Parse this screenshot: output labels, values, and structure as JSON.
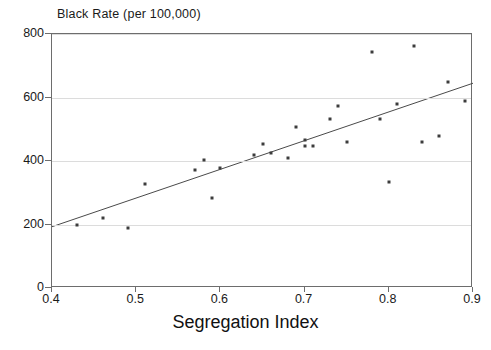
{
  "chart_data": {
    "type": "scatter",
    "title": "Black Rate (per 100,000)",
    "xlabel": "Segregation Index",
    "ylabel": "",
    "xlim": [
      0.4,
      0.9
    ],
    "ylim": [
      0,
      800
    ],
    "xticks": [
      "0.4",
      "0.5",
      "0.6",
      "0.7",
      "0.8",
      "0.9"
    ],
    "xtick_values": [
      0.4,
      0.5,
      0.6,
      0.7,
      0.8,
      0.9
    ],
    "yticks": [
      "0",
      "200",
      "400",
      "600",
      "800"
    ],
    "ytick_values": [
      0,
      200,
      400,
      600,
      800
    ],
    "grid": "horizontal",
    "legend": "none",
    "x": [
      0.43,
      0.46,
      0.49,
      0.51,
      0.57,
      0.58,
      0.59,
      0.6,
      0.64,
      0.65,
      0.66,
      0.68,
      0.69,
      0.7,
      0.7,
      0.71,
      0.73,
      0.74,
      0.75,
      0.78,
      0.79,
      0.8,
      0.81,
      0.83,
      0.84,
      0.86,
      0.87,
      0.89
    ],
    "y": [
      197,
      222,
      190,
      327,
      371,
      403,
      283,
      377,
      419,
      452,
      426,
      410,
      508,
      448,
      465,
      447,
      531,
      574,
      460,
      742,
      533,
      334,
      580,
      763,
      459,
      479,
      648,
      590
    ],
    "points": [
      {
        "x": 0.43,
        "y": 197
      },
      {
        "x": 0.46,
        "y": 222
      },
      {
        "x": 0.49,
        "y": 190
      },
      {
        "x": 0.51,
        "y": 327
      },
      {
        "x": 0.57,
        "y": 371
      },
      {
        "x": 0.58,
        "y": 403
      },
      {
        "x": 0.59,
        "y": 283
      },
      {
        "x": 0.6,
        "y": 377
      },
      {
        "x": 0.64,
        "y": 419
      },
      {
        "x": 0.65,
        "y": 452
      },
      {
        "x": 0.66,
        "y": 426
      },
      {
        "x": 0.68,
        "y": 410
      },
      {
        "x": 0.69,
        "y": 508
      },
      {
        "x": 0.7,
        "y": 448
      },
      {
        "x": 0.7,
        "y": 465
      },
      {
        "x": 0.71,
        "y": 447
      },
      {
        "x": 0.73,
        "y": 531
      },
      {
        "x": 0.74,
        "y": 574
      },
      {
        "x": 0.75,
        "y": 460
      },
      {
        "x": 0.78,
        "y": 742
      },
      {
        "x": 0.79,
        "y": 533
      },
      {
        "x": 0.8,
        "y": 334
      },
      {
        "x": 0.81,
        "y": 580
      },
      {
        "x": 0.83,
        "y": 763
      },
      {
        "x": 0.84,
        "y": 459
      },
      {
        "x": 0.86,
        "y": 479
      },
      {
        "x": 0.87,
        "y": 648
      },
      {
        "x": 0.89,
        "y": 590
      }
    ],
    "series": [
      {
        "name": "Black Rate",
        "type": "scatter",
        "marker": "square",
        "color": "#3c3c3c"
      },
      {
        "name": "Regression line",
        "type": "line",
        "color": "#4a4a4a",
        "endpoints": [
          {
            "x": 0.4,
            "y": 193
          },
          {
            "x": 0.9,
            "y": 645
          }
        ]
      }
    ],
    "trendline": {
      "x_start": 0.4,
      "y_start": 193,
      "x_end": 0.9,
      "y_end": 645,
      "slope": 904,
      "intercept": -168.6
    },
    "colors": {
      "marker": "#3c3c3c",
      "trendline": "#4a4a4a",
      "axis": "#6d6d6d",
      "grid": "#dcdcdc",
      "text": "#1a1a1a",
      "background": "#ffffff"
    }
  }
}
